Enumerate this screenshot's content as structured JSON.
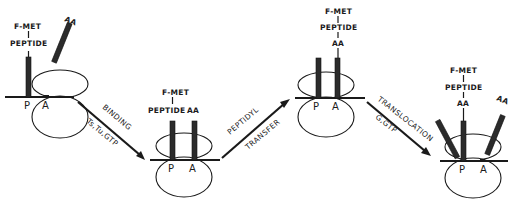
{
  "figure": {
    "stages": [
      {
        "id": "stage-1",
        "chain_labels": [
          "F-MET",
          "PEPTIDE"
        ],
        "incoming_label": "AA",
        "sites": [
          "P",
          "A"
        ]
      },
      {
        "id": "stage-2",
        "chain_labels": [
          "F-MET",
          "PEPTIDE"
        ],
        "a_site_label": "AA",
        "sites": [
          "P",
          "A"
        ]
      },
      {
        "id": "stage-3",
        "chain_labels": [
          "F-MET",
          "PEPTIDE",
          "AA"
        ],
        "sites": [
          "P",
          "A"
        ]
      },
      {
        "id": "stage-4",
        "chain_labels": [
          "F-MET",
          "PEPTIDE",
          "AA"
        ],
        "incoming_label": "AA",
        "sites": [
          "P",
          "A"
        ]
      }
    ],
    "arrows": [
      {
        "id": "binding",
        "label": "BINDING",
        "sublabel": "Ts,Tu,GTP"
      },
      {
        "id": "peptidyl-transfer",
        "label": "PEPTIDYL",
        "sublabel": "TRANSFER"
      },
      {
        "id": "translocation",
        "label": "TRANSLOCATION",
        "sublabel": "G,GTP"
      }
    ]
  }
}
